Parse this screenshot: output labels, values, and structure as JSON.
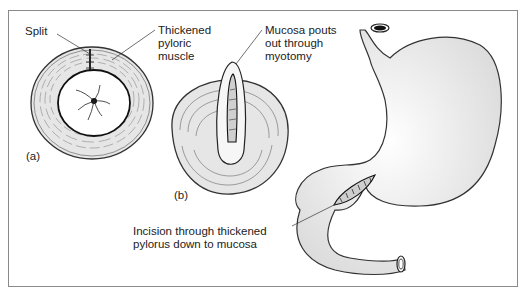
{
  "figure": {
    "panel_a": {
      "label": "(a)",
      "annotations": {
        "split": "Split",
        "thickened_muscle": "Thickened\npyloric\nmuscle"
      }
    },
    "panel_b": {
      "label": "(b)",
      "annotations": {
        "mucosa": "Mucosa pouts\nout through\nmyotomy"
      }
    },
    "panel_c": {
      "annotations": {
        "incision": "Incision through thickened\npylorus down to mucosa"
      }
    }
  },
  "colors": {
    "frame": "#8a8a8a",
    "ink": "#222222",
    "muscle_fill": "#e6e6e6",
    "stomach_fill": "#f2f2f2"
  }
}
